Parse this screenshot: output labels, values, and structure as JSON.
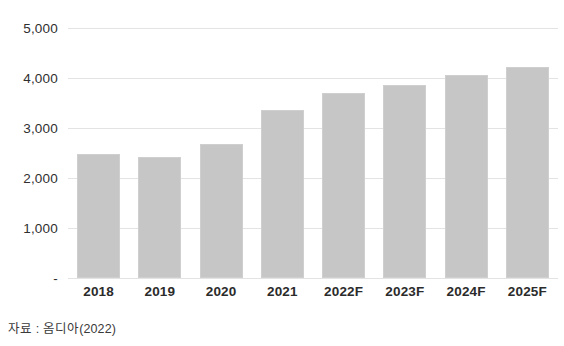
{
  "chart_data": {
    "type": "bar",
    "title": "",
    "subtitle": "",
    "xlabel": "",
    "ylabel": "",
    "categories": [
      "2018",
      "2019",
      "2020",
      "2021",
      "2022F",
      "2023F",
      "2024F",
      "2025F"
    ],
    "values": [
      2490,
      2420,
      2690,
      3360,
      3700,
      3870,
      4060,
      4220
    ],
    "series": [
      {
        "name": "",
        "values": [
          2490,
          2420,
          2690,
          3360,
          3700,
          3870,
          4060,
          4220
        ]
      }
    ],
    "ylim": [
      0,
      5000
    ],
    "ytick_values": [
      0,
      1000,
      2000,
      3000,
      4000,
      5000
    ],
    "ytick_labels": [
      "-",
      "1,000",
      "2,000",
      "3,000",
      "4,000",
      "5,000"
    ],
    "grid": true,
    "grid_axis": "y",
    "legend": false,
    "legend_position": "none",
    "bar_color": "#c6c6c6",
    "bar_border_color": "#cfcfcf",
    "gridline_color": "#e3e3e3",
    "text_color": "#2b2b2b",
    "background": "#ffffff",
    "annotations": []
  },
  "footer": {
    "source_note": "자료 : 옴디아(2022)"
  }
}
